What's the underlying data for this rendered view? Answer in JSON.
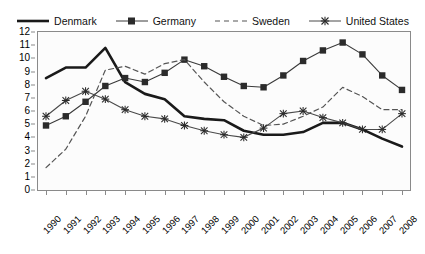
{
  "chart_data": {
    "type": "line",
    "title": "",
    "subtitle": "",
    "xlabel": "",
    "ylabel": "",
    "grid": false,
    "legend_position": "top",
    "x": [
      "1990",
      "1991",
      "1992",
      "1993",
      "1994",
      "1995",
      "1996",
      "1997",
      "1998",
      "1999",
      "2000",
      "2001",
      "2002",
      "2003",
      "2004",
      "2005",
      "2006",
      "2007",
      "2008"
    ],
    "categories": [
      "1990",
      "1991",
      "1992",
      "1993",
      "1994",
      "1995",
      "1996",
      "1997",
      "1998",
      "1999",
      "2000",
      "2001",
      "2002",
      "2003",
      "2004",
      "2005",
      "2006",
      "2007",
      "2008"
    ],
    "xlim": [
      "1990",
      "2008"
    ],
    "ylim": [
      0,
      12
    ],
    "ytick_labels": [
      "0",
      "1",
      "2",
      "3",
      "4",
      "5",
      "6",
      "7",
      "8",
      "9",
      "10",
      "11",
      "12"
    ],
    "yticks": [
      0,
      1,
      2,
      3,
      4,
      5,
      6,
      7,
      8,
      9,
      10,
      11,
      12
    ],
    "series": [
      {
        "name": "Denmark",
        "style": "solid-thick",
        "marker": "none",
        "color": "#1a1a1a",
        "values": [
          8.5,
          9.3,
          9.3,
          10.8,
          8.2,
          7.3,
          6.9,
          5.6,
          5.4,
          5.3,
          4.5,
          4.2,
          4.2,
          4.4,
          5.1,
          5.1,
          4.6,
          3.9,
          3.3
        ]
      },
      {
        "name": "Germany",
        "style": "solid-thin",
        "marker": "square",
        "color": "#3a3a3a",
        "values": [
          4.9,
          5.6,
          6.7,
          7.9,
          8.5,
          8.2,
          8.9,
          9.9,
          9.4,
          8.6,
          7.9,
          7.8,
          8.7,
          9.8,
          10.6,
          11.2,
          10.3,
          8.7,
          7.6
        ]
      },
      {
        "name": "Sweden",
        "style": "dashed",
        "marker": "none",
        "color": "#555555",
        "values": [
          1.7,
          3.1,
          5.6,
          9.1,
          9.4,
          8.8,
          9.6,
          9.9,
          8.2,
          6.7,
          5.6,
          4.9,
          5.0,
          5.6,
          6.3,
          7.8,
          7.1,
          6.1,
          6.1
        ]
      },
      {
        "name": "United States",
        "style": "solid-thin",
        "marker": "star",
        "color": "#4a4a4a",
        "values": [
          5.6,
          6.8,
          7.5,
          6.9,
          6.1,
          5.6,
          5.4,
          4.9,
          4.5,
          4.2,
          4.0,
          4.7,
          5.8,
          6.0,
          5.5,
          5.1,
          4.6,
          4.6,
          5.8
        ]
      }
    ]
  },
  "legend": {
    "items": [
      {
        "label": "Denmark"
      },
      {
        "label": "Germany"
      },
      {
        "label": "Sweden"
      },
      {
        "label": "United States"
      }
    ]
  }
}
